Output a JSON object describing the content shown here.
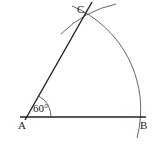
{
  "figure": {
    "type": "geometric-construction",
    "points": {
      "A": {
        "label": "A",
        "x": 27,
        "y": 117
      },
      "B": {
        "label": "B",
        "x": 139,
        "y": 117
      },
      "C": {
        "label": "C",
        "x": 83,
        "y": 17
      }
    },
    "angle": {
      "vertex": "A",
      "value_label": "60°"
    },
    "colors": {
      "line": "#222222",
      "arc": "#555555",
      "background": "#ffffff"
    }
  }
}
